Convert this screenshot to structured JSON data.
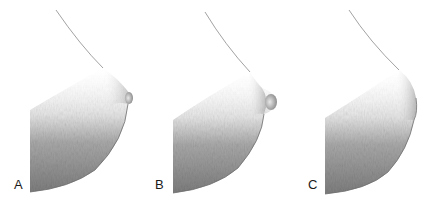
{
  "figure": {
    "panels": [
      {
        "label": "A",
        "description": "profile illustration, nipple-areola protruding, conical"
      },
      {
        "label": "B",
        "description": "profile illustration, areola domed with projecting nipple"
      },
      {
        "label": "C",
        "description": "profile illustration, flattened areola, no projection"
      }
    ],
    "colors": {
      "background": "#ffffff",
      "shade_dark": "#7a7a7a",
      "shade_mid": "#a8a8a8",
      "shade_light": "#dcdcdc",
      "outline": "#6a6a6a",
      "label": "#1a1a1a"
    }
  }
}
